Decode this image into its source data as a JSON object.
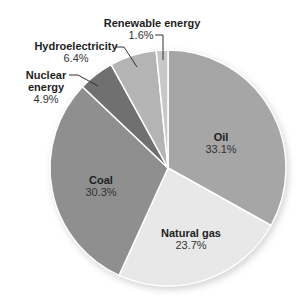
{
  "chart_data": {
    "type": "pie",
    "title": "",
    "start": "top",
    "direction": "clockwise",
    "slices": [
      {
        "label": "Oil",
        "value": 33.1,
        "value_label": "33.1%",
        "color": "#a6a6a6"
      },
      {
        "label": "Natural gas",
        "value": 23.7,
        "value_label": "23.7%",
        "color": "#e8e8e8"
      },
      {
        "label": "Coal",
        "value": 30.3,
        "value_label": "30.3%",
        "color": "#8f8f8f"
      },
      {
        "label": "Nuclear energy",
        "label_lines": [
          "Nuclear",
          "energy"
        ],
        "value": 4.9,
        "value_label": "4.9%",
        "color": "#707070"
      },
      {
        "label": "Hydroelectricity",
        "value": 6.4,
        "value_label": "6.4%",
        "color": "#b4b4b4"
      },
      {
        "label": "Renewable energy",
        "value": 1.6,
        "value_label": "1.6%",
        "color": "#c8c8c8"
      }
    ]
  }
}
